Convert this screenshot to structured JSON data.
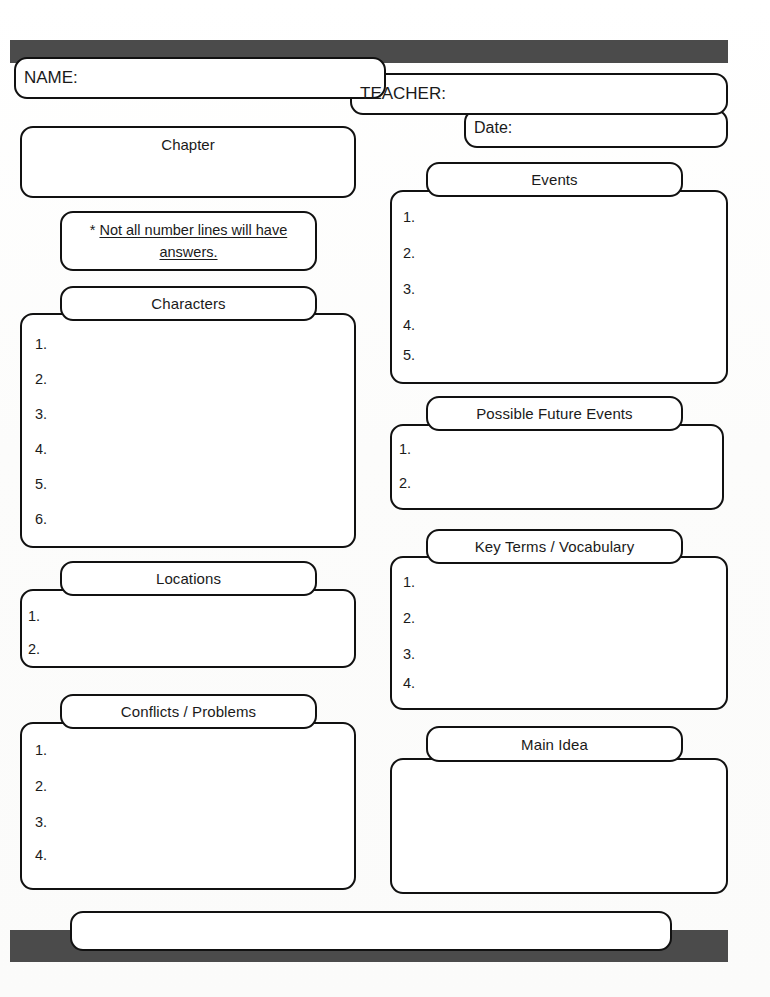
{
  "page": {
    "background_color": "#fdfdfd",
    "bar_color": "#4b4b4b",
    "border_color": "#111111"
  },
  "header": {
    "name_label": "NAME:",
    "teacher_label": "TEACHER:",
    "date_label": "Date:"
  },
  "note": {
    "asterisk": "*",
    "text": "Not all number lines will have answers."
  },
  "sections": {
    "chapter": {
      "title": "Chapter",
      "items": []
    },
    "characters": {
      "title": "Characters",
      "items": [
        "1.",
        "2.",
        "3.",
        "4.",
        "5.",
        "6."
      ]
    },
    "locations": {
      "title": "Locations",
      "items": [
        "1.",
        "2."
      ]
    },
    "conflicts": {
      "title": "Conflicts / Problems",
      "items": [
        "1.",
        "2.",
        "3.",
        "4."
      ]
    },
    "events": {
      "title": "Events",
      "items": [
        "1.",
        "2.",
        "3.",
        "4.",
        "5."
      ]
    },
    "future_events": {
      "title": "Possible Future Events",
      "items": [
        "1.",
        "2."
      ]
    },
    "key_terms": {
      "title": "Key Terms / Vocabulary",
      "items": [
        "1.",
        "2.",
        "3.",
        "4."
      ]
    },
    "main_idea": {
      "title": "Main Idea",
      "items": []
    }
  },
  "footer": {
    "value": ""
  }
}
